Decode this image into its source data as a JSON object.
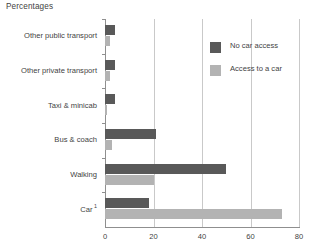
{
  "chart_data": {
    "type": "bar",
    "orientation": "horizontal",
    "title": "Percentages",
    "xlabel": "",
    "ylabel": "",
    "xlim": [
      0,
      80
    ],
    "xticks": [
      0,
      20,
      40,
      60,
      80
    ],
    "grid": true,
    "legend_position": "top-right",
    "categories": [
      "Other public transport",
      "Other private transport",
      "Taxi & minicab",
      "Bus & coach",
      "Walking",
      "Car"
    ],
    "category_footnotes": {
      "Car": "1"
    },
    "series": [
      {
        "name": "No car access",
        "color": "#595959",
        "values": [
          4,
          4,
          4,
          21,
          50,
          18
        ]
      },
      {
        "name": "Access to a car",
        "color": "#b3b3b3",
        "values": [
          2,
          2,
          1,
          3,
          20,
          73
        ]
      }
    ]
  },
  "axis": {
    "tick_labels": [
      "0",
      "20",
      "40",
      "60",
      "80"
    ]
  },
  "legend": {
    "items": [
      {
        "label": "No car access"
      },
      {
        "label": "Access to a car"
      }
    ]
  }
}
